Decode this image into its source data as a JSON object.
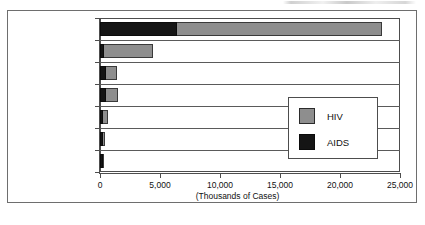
{
  "chart_data": {
    "type": "bar",
    "orientation": "horizontal",
    "stacked": true,
    "title": "",
    "xlabel": "(Thousands of Cases)",
    "ylabel": "",
    "xlim": [
      0,
      25000
    ],
    "xticks": [
      0,
      5000,
      10000,
      15000,
      20000,
      25000
    ],
    "xtick_labels": [
      "0",
      "5,000",
      "10,000",
      "15,000",
      "20,000",
      "25,000"
    ],
    "grid": false,
    "legend_position": "inside-right",
    "categories": [
      "Sub-Saharan Africa",
      "Southeast Asia",
      "Latin America",
      "North America",
      "Western Europe",
      "Caribbean",
      "Other"
    ],
    "series": [
      {
        "name": "AIDS",
        "color": "#151515",
        "values": [
          6400,
          300,
          500,
          500,
          200,
          150,
          150
        ]
      },
      {
        "name": "HIV",
        "color": "#8e8e8e",
        "values": [
          17100,
          4100,
          900,
          1000,
          400,
          200,
          50
        ]
      }
    ],
    "totals": [
      23500,
      4400,
      1400,
      1500,
      600,
      350,
      200
    ]
  },
  "axis": {
    "x_title": "(Thousands of Cases)",
    "tick_labels": [
      "0",
      "5,000",
      "10,000",
      "15,000",
      "20,000",
      "25,000"
    ]
  },
  "categories": [
    {
      "label": "Sub-Saharan Africa"
    },
    {
      "label": "Southeast Asia"
    },
    {
      "label": "Latin America"
    },
    {
      "label": "North America"
    },
    {
      "label": "Western Europe"
    },
    {
      "label": "Caribbean"
    },
    {
      "label": "Other"
    }
  ],
  "legend": {
    "items": [
      {
        "label": "HIV",
        "color": "#8e8e8e",
        "icon": "legend-swatch-hiv"
      },
      {
        "label": "AIDS",
        "color": "#151515",
        "icon": "legend-swatch-aids"
      }
    ]
  },
  "colors": {
    "hiv": "#8e8e8e",
    "aids": "#151515",
    "frame": "#6e6e6e",
    "axis": "#4d4d4d",
    "text": "#111111",
    "background": "#ffffff"
  }
}
